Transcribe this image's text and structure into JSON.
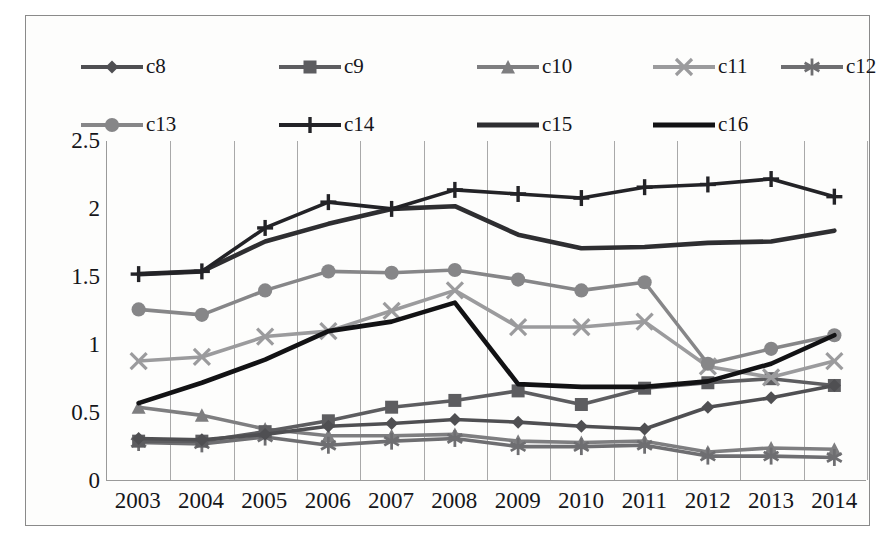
{
  "chart_data": {
    "type": "line",
    "title": "",
    "xlabel": "",
    "ylabel": "",
    "categories": [
      "2003",
      "2004",
      "2005",
      "2006",
      "2007",
      "2008",
      "2009",
      "2010",
      "2011",
      "2012",
      "2013",
      "2014"
    ],
    "ylim": [
      0,
      2.5
    ],
    "yticks": [
      "0",
      "0.5",
      "1",
      "1.5",
      "2",
      "2.5"
    ],
    "ytick_values": [
      0,
      0.5,
      1,
      1.5,
      2,
      2.5
    ],
    "grid": "vertical",
    "legend_position": "top",
    "series": [
      {
        "name": "c8",
        "marker": "diamond",
        "color": "#4f4f52",
        "values": [
          0.31,
          0.3,
          0.34,
          0.4,
          0.42,
          0.45,
          0.43,
          0.4,
          0.38,
          0.54,
          0.61,
          0.7
        ]
      },
      {
        "name": "c9",
        "marker": "square",
        "color": "#5d5d60",
        "values": [
          0.29,
          0.29,
          0.36,
          0.44,
          0.54,
          0.59,
          0.66,
          0.56,
          0.68,
          0.72,
          0.75,
          0.7
        ]
      },
      {
        "name": "c10",
        "marker": "triangle",
        "color": "#7e7e80",
        "values": [
          0.54,
          0.48,
          0.38,
          0.33,
          0.33,
          0.34,
          0.29,
          0.28,
          0.29,
          0.21,
          0.24,
          0.23
        ]
      },
      {
        "name": "c11",
        "marker": "cross",
        "color": "#9b9b9d",
        "values": [
          0.88,
          0.91,
          1.06,
          1.1,
          1.25,
          1.4,
          1.13,
          1.13,
          1.17,
          0.84,
          0.76,
          0.88
        ]
      },
      {
        "name": "c12",
        "marker": "asterisk",
        "color": "#6e6e71",
        "values": [
          0.28,
          0.27,
          0.32,
          0.26,
          0.29,
          0.31,
          0.25,
          0.25,
          0.26,
          0.18,
          0.18,
          0.17
        ]
      },
      {
        "name": "c13",
        "marker": "circle",
        "color": "#868688",
        "values": [
          1.26,
          1.22,
          1.4,
          1.54,
          1.53,
          1.55,
          1.48,
          1.4,
          1.46,
          0.86,
          0.97,
          1.07
        ]
      },
      {
        "name": "c14",
        "marker": "plus",
        "color": "#232327",
        "values": [
          1.52,
          1.54,
          1.86,
          2.05,
          2.0,
          2.14,
          2.11,
          2.08,
          2.16,
          2.18,
          2.22,
          2.09
        ]
      },
      {
        "name": "c15",
        "marker": "none",
        "color": "#2e2e31",
        "values": [
          1.52,
          1.54,
          1.76,
          1.89,
          2.0,
          2.02,
          1.81,
          1.71,
          1.72,
          1.75,
          1.76,
          1.84
        ]
      },
      {
        "name": "c16",
        "marker": "none",
        "color": "#121214",
        "values": [
          0.57,
          0.72,
          0.89,
          1.1,
          1.17,
          1.31,
          0.71,
          0.69,
          0.69,
          0.73,
          0.86,
          1.07
        ]
      }
    ]
  },
  "legend": {
    "rows": [
      [
        "c8",
        "c9",
        "c10",
        "c11",
        "c12"
      ],
      [
        "c13",
        "c14",
        "c15",
        "c16"
      ]
    ]
  }
}
